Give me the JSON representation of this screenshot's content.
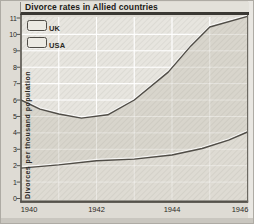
{
  "title": "Divorce rates in Allied countries",
  "legend": {
    "items": [
      {
        "label": "UK"
      },
      {
        "label": "USA"
      }
    ]
  },
  "chart_data": {
    "type": "line",
    "title": "Divorce rates in Allied countries",
    "xlabel": "",
    "ylabel": "Divorces per thousand population",
    "xlim": [
      1940,
      1946
    ],
    "ylim": [
      0,
      11.3
    ],
    "xticks": [
      1940,
      1942,
      1944,
      1946
    ],
    "yticks": [
      0,
      1,
      2,
      3,
      4,
      5,
      6,
      7,
      8,
      9,
      10,
      11
    ],
    "grid": "white gridlines, most visible above the UK line",
    "legend_position": "top-left",
    "series": [
      {
        "name": "UK",
        "points": [
          [
            1940,
            6.0
          ],
          [
            1940.5,
            5.45
          ],
          [
            1941,
            5.15
          ],
          [
            1941.6,
            4.9
          ],
          [
            1942.3,
            5.1
          ],
          [
            1943,
            6.0
          ],
          [
            1943.9,
            7.7
          ],
          [
            1944.5,
            9.3
          ],
          [
            1945,
            10.45
          ],
          [
            1946,
            11.1
          ]
        ]
      },
      {
        "name": "USA",
        "points": [
          [
            1940,
            1.85
          ],
          [
            1941,
            2.05
          ],
          [
            1942,
            2.3
          ],
          [
            1943,
            2.4
          ],
          [
            1944,
            2.65
          ],
          [
            1944.8,
            3.05
          ],
          [
            1945.5,
            3.55
          ],
          [
            1946,
            4.05
          ]
        ]
      }
    ],
    "colors": {
      "line": "#504d47",
      "line_highlight": "rgba(255,255,255,0.75)",
      "area_above_uk": "#e7e5df",
      "area_between": "#d8d5cc",
      "area_below_usa": "#dedbd3",
      "gridline": "#ffffff",
      "axis": "#55524b",
      "hatch": "rgba(105,100,90,0.14)"
    }
  }
}
